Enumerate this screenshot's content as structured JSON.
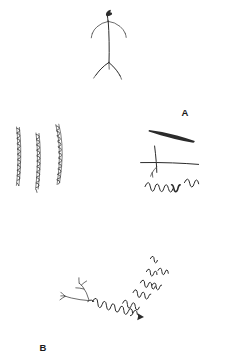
{
  "figure": {
    "background_color": "#ffffff",
    "ink_color": "#2b2b2b",
    "width": 230,
    "height": 363,
    "panels": [
      {
        "id": "a",
        "label": "A",
        "description": "Single vertical filament with dark bulbous tip at top, two drooping lateral arms near the top and a Y-shaped basal fork",
        "feature_count": 1
      },
      {
        "id": "b",
        "label": "B",
        "description": "Three near-vertical beaded strands composed of small chained loops",
        "feature_count": 3
      },
      {
        "id": "c",
        "label": "C",
        "description": "Tapered thick stroke above, a cross-shaped filament with a short basal branch, and a detached zigzag segment below",
        "feature_count": 3
      },
      {
        "id": "d",
        "label": "D",
        "description": "Branched cell with dendritic forks on the left continuing into a long zigzag process ending in an arrowhead, with six detached zigzag fragments scattered to the upper right",
        "feature_count": 7
      }
    ]
  }
}
